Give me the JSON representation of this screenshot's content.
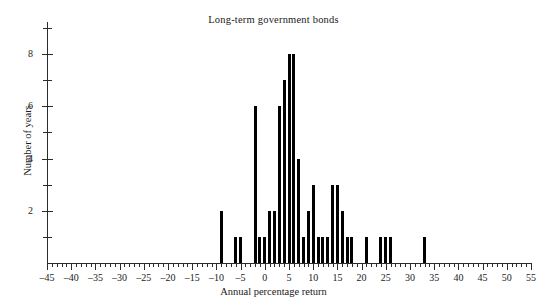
{
  "chart_data": {
    "type": "bar",
    "title": "Long-term government bonds",
    "xlabel": "Annual percentage return",
    "ylabel": "Number of years",
    "xlim": [
      -45,
      55
    ],
    "ylim": [
      0,
      9
    ],
    "grid": false,
    "legend": null,
    "x_major_step": 5,
    "x_minor_step": 1,
    "y_major_step": 2,
    "y_minor_step": 1,
    "x_tick_labels": [
      "-45",
      "-40",
      "-35",
      "-30",
      "-25",
      "-20",
      "-15",
      "-10",
      "-5",
      "0",
      "5",
      "10",
      "15",
      "20",
      "25",
      "30",
      "35",
      "40",
      "45",
      "50",
      "55"
    ],
    "y_tick_labels": [
      "2",
      "4",
      "6",
      "8"
    ],
    "categories": [
      -9,
      -6,
      -5,
      -2,
      -1,
      0,
      1,
      2,
      3,
      4,
      5,
      6,
      7,
      8,
      9,
      10,
      11,
      12,
      13,
      14,
      15,
      16,
      17,
      18,
      21,
      24,
      25,
      26,
      33
    ],
    "values": [
      2,
      1,
      1,
      6,
      1,
      1,
      2,
      2,
      6,
      7,
      8,
      8,
      4,
      1,
      2,
      3,
      1,
      1,
      1,
      3,
      3,
      2,
      1,
      1,
      1,
      1,
      1,
      1,
      1
    ]
  }
}
